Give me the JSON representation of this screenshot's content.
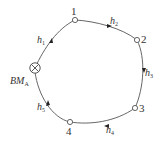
{
  "diagram": {
    "type": "closed leveling route",
    "benchmark": {
      "label": "BM",
      "subscript": "A"
    },
    "points": [
      {
        "label": "1"
      },
      {
        "label": "2"
      },
      {
        "label": "3"
      },
      {
        "label": "4"
      }
    ],
    "segments": [
      {
        "label": "h",
        "subscript": "1",
        "from": "BM_A",
        "to": "1"
      },
      {
        "label": "h",
        "subscript": "2",
        "from": "1",
        "to": "2"
      },
      {
        "label": "h",
        "subscript": "3",
        "from": "2",
        "to": "3"
      },
      {
        "label": "h",
        "subscript": "4",
        "from": "3",
        "to": "4"
      },
      {
        "label": "h",
        "subscript": "5",
        "from": "4",
        "to": "BM_A"
      }
    ],
    "colors": {
      "line": "#555555",
      "text": "#333333"
    }
  }
}
